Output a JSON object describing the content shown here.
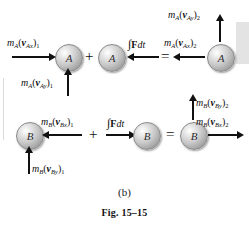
{
  "figure": {
    "caption_part": "(b)",
    "caption_figure": "Fig. 15–15",
    "background_color": "#ffffff",
    "ink_color": "#111111"
  },
  "operators": {
    "row1_plus": "+",
    "row1_equals": "=",
    "row2_plus": "+",
    "row2_equals": "="
  },
  "spheres": {
    "a1": "A",
    "a2": "A",
    "a3": "A",
    "b1": "B",
    "b2": "B",
    "b3": "B"
  },
  "impulse": {
    "row1": {
      "integral": "∫",
      "force": "F",
      "differential": "dt"
    },
    "row2": {
      "integral": "∫",
      "force": "F",
      "differential": "dt"
    }
  },
  "labels": {
    "row1": {
      "initial_x": {
        "mass": "m",
        "mass_sub": "A",
        "vector": "v",
        "vector_sub": "Ax",
        "state_sub": "1",
        "direction": "right"
      },
      "initial_y": {
        "mass": "m",
        "mass_sub": "A",
        "vector": "v",
        "vector_sub": "Ay",
        "state_sub": "1",
        "direction": "up"
      },
      "final_x": {
        "mass": "m",
        "mass_sub": "A",
        "vector": "v",
        "vector_sub": "Ax",
        "state_sub": "2",
        "direction": "left"
      },
      "final_y": {
        "mass": "m",
        "mass_sub": "A",
        "vector": "v",
        "vector_sub": "Ay",
        "state_sub": "2",
        "direction": "up"
      }
    },
    "row2": {
      "initial_x": {
        "mass": "m",
        "mass_sub": "B",
        "vector": "v",
        "vector_sub": "Bx",
        "state_sub": "1",
        "direction": "left"
      },
      "initial_y": {
        "mass": "m",
        "mass_sub": "B",
        "vector": "v",
        "vector_sub": "By",
        "state_sub": "1",
        "direction": "up"
      },
      "final_x": {
        "mass": "m",
        "mass_sub": "B",
        "vector": "v",
        "vector_sub": "Bx",
        "state_sub": "2",
        "direction": "right"
      },
      "final_y": {
        "mass": "m",
        "mass_sub": "B",
        "vector": "v",
        "vector_sub": "By",
        "state_sub": "2",
        "direction": "up"
      }
    }
  }
}
